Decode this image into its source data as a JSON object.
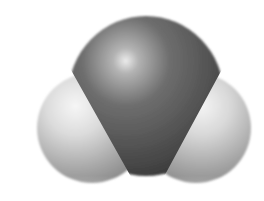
{
  "figure": {
    "subject": "space-filling model of a water molecule",
    "atoms": [
      {
        "id": "oxygen",
        "label": "O",
        "color": "#5a5a5a",
        "highlight": "#e6e6e6",
        "cx": 145,
        "cy": 82,
        "r": 76
      },
      {
        "id": "hydrogen-left",
        "label": "H",
        "color": "#bdbdbd",
        "highlight": "#f4f4f4",
        "cx": 92,
        "cy": 128,
        "r": 55
      },
      {
        "id": "hydrogen-right",
        "label": "H",
        "color": "#bdbdbd",
        "highlight": "#f4f4f4",
        "cx": 196,
        "cy": 128,
        "r": 55
      }
    ],
    "background": "#ffffff"
  }
}
